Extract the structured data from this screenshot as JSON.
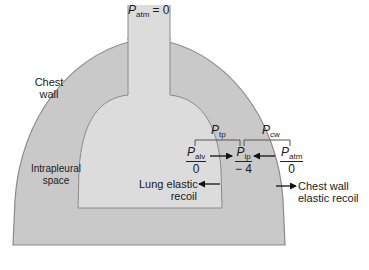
{
  "diagram": {
    "type": "lung-chest-wall-pressure-schematic",
    "colors": {
      "background": "#ffffff",
      "chest_wall_fill": "#c9c9c9",
      "lung_fill": "#dcdcdc",
      "outline": "#8a8a8a",
      "text": "#1a1a1a",
      "bracket": "#555555"
    },
    "top_label": {
      "symbol": "P",
      "subscript": "atm",
      "equals": "= 0"
    },
    "regions": {
      "chest_wall": {
        "line1": "Chest",
        "line2": "wall"
      },
      "intrapleural": {
        "line1": "Intrapleural",
        "line2": "space"
      }
    },
    "brackets": {
      "transpulmonary": {
        "symbol": "P",
        "subscript": "tp"
      },
      "chest_wall": {
        "symbol": "P",
        "subscript": "cw"
      }
    },
    "pressures": [
      {
        "id": "alveolar",
        "symbol": "P",
        "subscript": "alv",
        "value": "0"
      },
      {
        "id": "intrapleural",
        "symbol": "P",
        "subscript": "ip",
        "value": "− 4"
      },
      {
        "id": "atmospheric",
        "symbol": "P",
        "subscript": "atm",
        "value": "0"
      }
    ],
    "recoil_labels": {
      "lung": {
        "line1": "Lung elastic",
        "line2": "recoil"
      },
      "chest_wall": {
        "line1": "Chest wall",
        "line2": "elastic recoil"
      }
    }
  }
}
